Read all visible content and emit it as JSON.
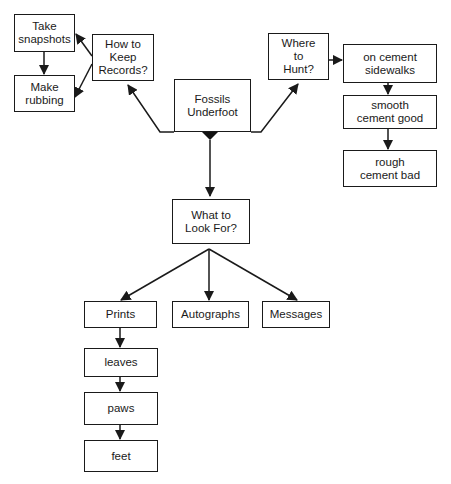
{
  "diagram": {
    "type": "concept-map",
    "nodes": [
      {
        "id": "root",
        "label": "Fossils\nUnderfoot"
      },
      {
        "id": "records",
        "label": "How to\nKeep\nRecords?"
      },
      {
        "id": "snapshots",
        "label": "Take\nsnapshots"
      },
      {
        "id": "rubbing",
        "label": "Make\nrubbing"
      },
      {
        "id": "hunt",
        "label": "Where\nto\nHunt?"
      },
      {
        "id": "sidewalks",
        "label": "on cement\nsidewalks"
      },
      {
        "id": "smooth",
        "label": "smooth\ncement good"
      },
      {
        "id": "rough",
        "label": "rough\ncement bad"
      },
      {
        "id": "lookfor",
        "label": "What to\nLook For?"
      },
      {
        "id": "prints",
        "label": "Prints"
      },
      {
        "id": "autographs",
        "label": "Autographs"
      },
      {
        "id": "messages",
        "label": "Messages"
      },
      {
        "id": "leaves",
        "label": "leaves"
      },
      {
        "id": "paws",
        "label": "paws"
      },
      {
        "id": "feet",
        "label": "feet"
      }
    ],
    "edges": [
      {
        "from": "root",
        "to": "records"
      },
      {
        "from": "root",
        "to": "hunt"
      },
      {
        "from": "root",
        "to": "lookfor"
      },
      {
        "from": "records",
        "to": "snapshots"
      },
      {
        "from": "records",
        "to": "rubbing"
      },
      {
        "from": "snapshots",
        "to": "rubbing"
      },
      {
        "from": "hunt",
        "to": "sidewalks"
      },
      {
        "from": "sidewalks",
        "to": "smooth"
      },
      {
        "from": "smooth",
        "to": "rough"
      },
      {
        "from": "lookfor",
        "to": "prints"
      },
      {
        "from": "lookfor",
        "to": "autographs"
      },
      {
        "from": "lookfor",
        "to": "messages"
      },
      {
        "from": "prints",
        "to": "leaves"
      },
      {
        "from": "leaves",
        "to": "paws"
      },
      {
        "from": "paws",
        "to": "feet"
      }
    ],
    "colors": {
      "ink": "#1a1a1a",
      "background": "#ffffff"
    }
  }
}
